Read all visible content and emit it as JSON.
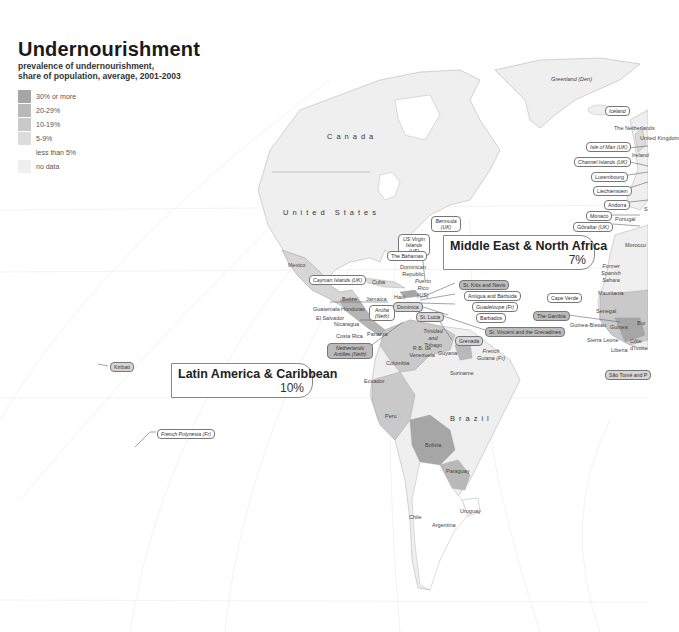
{
  "header": {
    "title": "Undernourishment",
    "subtitle_line1": "prevalence of undernourishment,",
    "subtitle_line2": "share of population, average, 2001-2003"
  },
  "legend": {
    "items": [
      {
        "label": "30% or  more",
        "color": "#a6a6a6"
      },
      {
        "label": "20-29%",
        "color": "#b9b9b9"
      },
      {
        "label": "10-19%",
        "color": "#c9c9c9"
      },
      {
        "label": "5-9%",
        "color": "#dcdcdc"
      },
      {
        "label": "less than 5%",
        "color": "#ffffff"
      },
      {
        "label": "no data",
        "color": "#efefef"
      }
    ]
  },
  "callouts": {
    "latin_america": {
      "title": "Latin America & Caribbean",
      "value": "10%"
    },
    "mena": {
      "title": "Middle East & North Africa",
      "value": "7%"
    }
  },
  "countries_large": {
    "canada": "Canada",
    "usa": "United States",
    "brazil": "Brazil"
  },
  "country_labels": {
    "mexico": "Mexico",
    "cuba": "Cuba",
    "belize": "Belize",
    "jamaica": "Jamaica",
    "haiti": "Haiti",
    "guatemala": "Guatemala",
    "honduras": "Honduras",
    "el_salvador": "El Salvador",
    "nicaragua": "Nicaragua",
    "costa_rica": "Costa Rica",
    "panama": "Panama",
    "dominican_republic": "Dominican Republic",
    "puerto_rico": "Puerto Rico (US)",
    "trinidad": "Trinidad and Tobago",
    "venezuela": "R.B. de Venezuela",
    "guyana": "Guyana",
    "suriname": "Suriname",
    "french_guiana": "French Guiana (Fr)",
    "colombia": "Colombia",
    "ecuador": "Ecuador",
    "peru": "Peru",
    "bolivia": "Bolivia",
    "paraguay": "Paraguay",
    "uruguay": "Uruguay",
    "chile": "Chile",
    "argentina": "Argentina",
    "greenland": "Greenland (Den)",
    "netherlands": "The Netherlands",
    "uk": "United Kingdom",
    "ireland": "Ireland",
    "portugal": "Portugal",
    "morocco": "Morocco",
    "western_sahara": "Former Spanish Sahara",
    "mauritania": "Mauritania",
    "senegal": "Senegal",
    "guinea_bissau": "Guinea-Bissau",
    "guinea": "Guinea",
    "sierra_leone": "Sierra Leone",
    "liberia": "Liberia",
    "cote_divoire": "Côte d'Ivoire",
    "burkina": "Bur",
    "spain": "S"
  },
  "pill_labels": {
    "iceland": "Iceland",
    "isle_of_man": "Isle of Man (UK)",
    "channel_islands": "Channel Islands (UK)",
    "luxembourg": "Luxembourg",
    "liechtenstein": "Liechtenstein",
    "andorra": "Andorra",
    "monaco": "Monaco",
    "gibraltar": "Gibraltar (UK)",
    "bermuda": "Bermuda (UK)",
    "us_virgin": "US Virgin Islands (US)",
    "bahamas": "The Bahamas",
    "cayman": "Cayman Islands (UK)",
    "aruba": "Aruba (Neth)",
    "dominica": "Dominica",
    "st_lucia": "St. Lucia",
    "grenada": "Grenada",
    "netherlands_antilles": "Netherlands Antilles (Neth)",
    "st_kitts": "St. Kitts and Nevis",
    "antigua": "Antigua and Barbuda",
    "guadeloupe": "Guadeloupe (Fr)",
    "barbados": "Barbados",
    "st_vincent": "St. Vincent and the Grenadines",
    "cape_verde": "Cape Verde",
    "gambia": "The Gambia",
    "sao_tome": "São Tomé and P",
    "kiribati": "Kiribati",
    "french_polynesia": "French Polynesia (Fr)"
  }
}
